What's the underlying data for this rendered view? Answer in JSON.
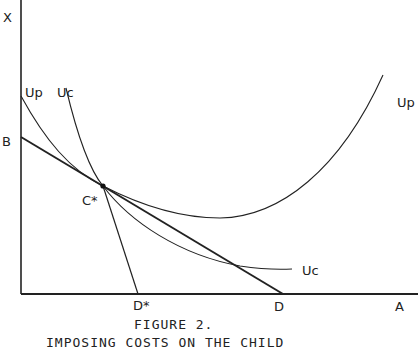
{
  "figure": {
    "caption_number": "FIGURE 2.",
    "caption_text": "IMPOSING COSTS ON THE CHILD"
  },
  "axes": {
    "y_label": "X",
    "x_label": "A",
    "y_intercept_label": "B",
    "x_intercept_label": "D",
    "x_star_label": "D*"
  },
  "points": {
    "tangency_label": "C*"
  },
  "curves": {
    "parent_indifference_label_left": "Up",
    "parent_indifference_label_right": "Up",
    "child_indifference_label_top": "Uc",
    "child_indifference_label_bottom": "Uc"
  },
  "colors": {
    "ink": "#222222",
    "background": "#ffffff"
  }
}
